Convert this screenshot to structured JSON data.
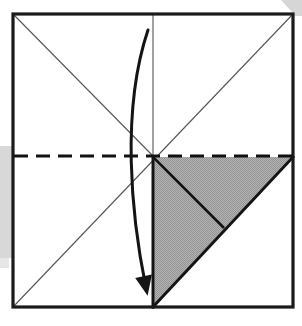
{
  "figure": {
    "kind": "origami-fold-diagram",
    "canvas": {
      "width": 302,
      "height": 326
    }
  },
  "colors": {
    "paper_white": "#ffffff",
    "paper_outline": "#1a1a1a",
    "crease_line": "#555555",
    "fold_line_dark": "#111111",
    "shaded_flap": "#a9a9a9",
    "shaded_flap_edge": "#141414",
    "drop_shadow": "#d4d4d4",
    "arrow": "#141414",
    "background": "#ffffff"
  },
  "geometry": {
    "sheet": {
      "name": "paper-square",
      "top_left": [
        13,
        14
      ],
      "top_right": [
        293,
        14
      ],
      "bottom_right": [
        293,
        307
      ],
      "bottom_left": [
        13,
        307
      ],
      "outline_width": 3.2
    },
    "center_point": [
      153,
      156
    ],
    "creases": [
      {
        "name": "diagonal-crease-bl-tr",
        "from": [
          13,
          307
        ],
        "to": [
          293,
          14
        ],
        "style": "thin-solid",
        "width": 1.1
      },
      {
        "name": "diagonal-crease-tl-center",
        "from": [
          13,
          14
        ],
        "to": [
          153,
          156
        ],
        "style": "thin-solid",
        "width": 1.1
      },
      {
        "name": "vertical-center-crease",
        "from": [
          153,
          14
        ],
        "to": [
          153,
          156
        ],
        "style": "thin-solid",
        "width": 1.1
      }
    ],
    "valley_fold_line": {
      "name": "horizontal-dashed-fold",
      "from": [
        14,
        156
      ],
      "to": [
        292,
        156
      ],
      "style": "dashed",
      "dash_length": 14,
      "gap_length": 8,
      "width": 3.0
    },
    "shaded_flap": {
      "name": "folded-triangle-flap",
      "points": [
        [
          153,
          157
        ],
        [
          293,
          157
        ],
        [
          153,
          307
        ]
      ],
      "fill": "shaded_flap",
      "edge_width": 3.0,
      "internal_crease": {
        "from": [
          153,
          157
        ],
        "to": [
          224,
          228
        ]
      }
    },
    "arrow": {
      "name": "fold-direction-arrow",
      "start": [
        148,
        30
      ],
      "control_1": [
        121,
        110
      ],
      "control_2": [
        131,
        215
      ],
      "end": [
        146,
        288
      ],
      "width": 3.0,
      "head_length": 20,
      "head_width": 17,
      "direction": "down"
    },
    "drop_shadows": [
      {
        "name": "shadow-left",
        "x": 0,
        "y": 146,
        "width": 13,
        "height": 112
      },
      {
        "name": "shadow-top-right",
        "x": 280,
        "y": 0,
        "width": 22,
        "height": 16
      }
    ]
  }
}
